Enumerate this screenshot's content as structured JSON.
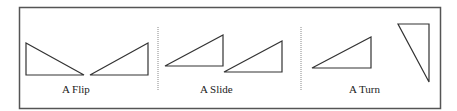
{
  "figure": {
    "panels": [
      {
        "id": "flip",
        "label": "A Flip"
      },
      {
        "id": "slide",
        "label": "A Slide"
      },
      {
        "id": "turn",
        "label": "A Turn"
      }
    ],
    "colors": {
      "stroke": "#333333",
      "border": "#555555",
      "divider": "#888888",
      "background": "#ffffff"
    }
  }
}
